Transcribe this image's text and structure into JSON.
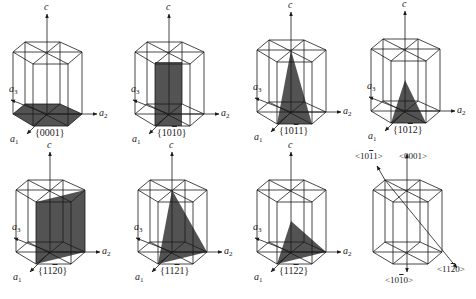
{
  "figure": {
    "stroke_color": "#1a1a1a",
    "fill_color": "#4a4a4a",
    "axis_labels": {
      "c": "c",
      "a1": "a",
      "a1_sub": "1",
      "a2": "a",
      "a2_sub": "2",
      "a3": "a",
      "a3_sub": "3"
    }
  },
  "panels": [
    {
      "id": "p0001",
      "cx": 47,
      "cy": 114,
      "plane": "basal",
      "label": "{0001}",
      "label_parts": [
        [
          "{0001}",
          false
        ]
      ]
    },
    {
      "id": "p10-10",
      "cx": 169,
      "cy": 114,
      "plane": "prism1",
      "label": "{10-10}",
      "label_parts": [
        [
          "{10",
          false
        ],
        [
          "1",
          true
        ],
        [
          "0}",
          false
        ]
      ]
    },
    {
      "id": "p10-11",
      "cx": 291,
      "cy": 112,
      "plane": "pyr1",
      "label": "{10-11}",
      "label_parts": [
        [
          "{10",
          false
        ],
        [
          "1",
          true
        ],
        [
          "1}",
          false
        ]
      ]
    },
    {
      "id": "p10-12",
      "cx": 405,
      "cy": 111,
      "plane": "pyr2",
      "label": "{10-12}",
      "label_parts": [
        [
          "{10",
          false
        ],
        [
          "1",
          true
        ],
        [
          "2}",
          false
        ]
      ]
    },
    {
      "id": "p11-20",
      "cx": 50,
      "cy": 252,
      "plane": "prism2",
      "label": "{11-20}",
      "label_parts": [
        [
          "{11",
          false
        ],
        [
          "2",
          true
        ],
        [
          "0}",
          false
        ]
      ]
    },
    {
      "id": "p11-21",
      "cx": 172,
      "cy": 252,
      "plane": "pyr3",
      "label": "{11-21}",
      "label_parts": [
        [
          "{11",
          false
        ],
        [
          "2",
          true
        ],
        [
          "1}",
          false
        ]
      ]
    },
    {
      "id": "p11-22",
      "cx": 291,
      "cy": 252,
      "plane": "pyr4",
      "label": "{11-22}",
      "label_parts": [
        [
          "{11",
          false
        ],
        [
          "2",
          true
        ],
        [
          "2}",
          false
        ]
      ]
    },
    {
      "id": "dirs",
      "cx": 407,
      "cy": 252,
      "plane": "directions",
      "label": "",
      "label_parts": []
    }
  ],
  "directions": [
    {
      "id": "d10-11",
      "label": "<10-11>",
      "label_parts": [
        [
          "<10",
          false
        ],
        [
          "1",
          true
        ],
        [
          "1>",
          false
        ]
      ]
    },
    {
      "id": "d0001",
      "label": "<0001>",
      "label_parts": [
        [
          "<0001>",
          false
        ]
      ]
    },
    {
      "id": "d10-10",
      "label": "<10-10>",
      "label_parts": [
        [
          "<10",
          false
        ],
        [
          "1",
          true
        ],
        [
          "0>",
          false
        ]
      ]
    },
    {
      "id": "d11-20",
      "label": "<11-20>",
      "label_parts": [
        [
          "<11",
          false
        ],
        [
          "2",
          true
        ],
        [
          "0>",
          false
        ]
      ]
    }
  ]
}
